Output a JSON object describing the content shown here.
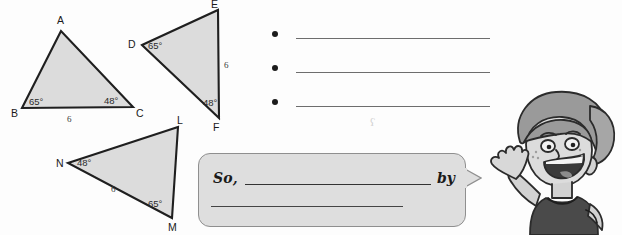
{
  "worksheet": {
    "background_color": "#fdfdfd",
    "shape_fill": "#dcdcdc",
    "shape_stroke": "#1f1f1f"
  },
  "triangles": [
    {
      "id": "triangle-abc",
      "vertices": [
        {
          "label": "A",
          "x": 61,
          "y": 31
        },
        {
          "label": "B",
          "x": 22,
          "y": 108
        },
        {
          "label": "C",
          "x": 133,
          "y": 107
        }
      ],
      "angles": [
        {
          "at": "B",
          "value": "65°"
        },
        {
          "at": "C",
          "value": "48°"
        }
      ],
      "sides": [
        {
          "between": "BC",
          "value": "6"
        }
      ]
    },
    {
      "id": "triangle-def",
      "vertices": [
        {
          "label": "D",
          "x": 142,
          "y": 45
        },
        {
          "label": "E",
          "x": 218,
          "y": 10
        },
        {
          "label": "F",
          "x": 219,
          "y": 118
        }
      ],
      "angles": [
        {
          "at": "D",
          "value": "65°"
        },
        {
          "at": "F",
          "value": "48°"
        }
      ],
      "sides": [
        {
          "between": "EF",
          "value": "6"
        }
      ]
    },
    {
      "id": "triangle-lmn",
      "vertices": [
        {
          "label": "L",
          "x": 178,
          "y": 127
        },
        {
          "label": "M",
          "x": 172,
          "y": 218
        },
        {
          "label": "N",
          "x": 68,
          "y": 163
        }
      ],
      "angles": [
        {
          "at": "N",
          "value": "48°"
        },
        {
          "at": "M",
          "value": "65°"
        }
      ],
      "sides": [
        {
          "between": "NM",
          "value": "6"
        }
      ]
    }
  ],
  "answer_list": {
    "bullet_glyph": "•",
    "items": [
      {
        "text": ""
      },
      {
        "text": ""
      },
      {
        "text": ""
      }
    ]
  },
  "conclusion_bubble": {
    "lead_label": "So,",
    "connector_label": "by",
    "line_one_value": "",
    "line_two_value": "",
    "fill_color": "#dedede",
    "border_color": "#8f8f8f"
  },
  "stray_mark": {
    "glyph": "ʕ"
  },
  "character": {
    "name": "waving-cartoon-boy",
    "shirt_color": "#4a4a4a",
    "skin_color": "#d9d9d9",
    "hair_color": "#9a9a9a"
  }
}
